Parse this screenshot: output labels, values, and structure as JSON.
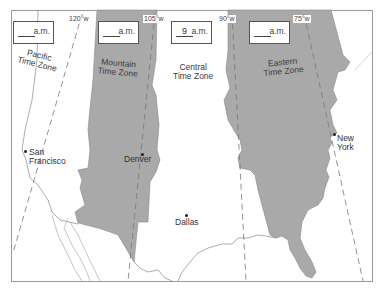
{
  "map": {
    "title": "US Time Zones",
    "colors": {
      "shaded_zone": "#a9a9a9",
      "unshaded_zone": "#ffffff",
      "border_line": "#888888",
      "frame": "#999999"
    },
    "meridians": [
      {
        "label": "120°w"
      },
      {
        "label": "105°w"
      },
      {
        "label": "90°w"
      },
      {
        "label": "75°w"
      }
    ],
    "zones": [
      {
        "name_line1": "Pacific",
        "name_line2": "Time Zone",
        "time_value": "",
        "time_suffix": "a.m.",
        "shaded": false
      },
      {
        "name_line1": "Mountain",
        "name_line2": "Time Zone",
        "time_value": "",
        "time_suffix": "a.m.",
        "shaded": true
      },
      {
        "name_line1": "Central",
        "name_line2": "Time Zone",
        "time_value": "9",
        "time_suffix": "a.m.",
        "shaded": false
      },
      {
        "name_line1": "Eastern",
        "name_line2": "Time Zone",
        "time_value": "",
        "time_suffix": "a.m.",
        "shaded": true
      }
    ],
    "cities": [
      {
        "line1": "San",
        "line2": "Francisco"
      },
      {
        "line1": "Denver",
        "line2": ""
      },
      {
        "line1": "Dallas",
        "line2": ""
      },
      {
        "line1": "New",
        "line2": "York"
      }
    ]
  }
}
